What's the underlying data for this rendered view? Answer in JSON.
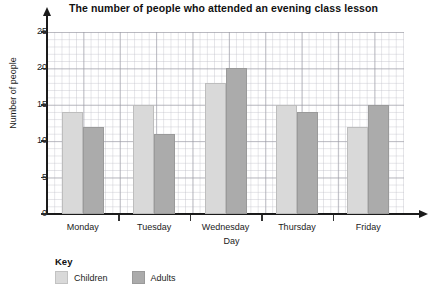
{
  "chart_data": {
    "type": "bar",
    "title": "The number of people who attended an evening class lesson",
    "xlabel": "Day",
    "ylabel": "Number of people",
    "categories": [
      "Monday",
      "Tuesday",
      "Wednesday",
      "Thursday",
      "Friday"
    ],
    "series": [
      {
        "name": "Children",
        "values": [
          14,
          15,
          18,
          15,
          12
        ],
        "color": "#d9d9d9"
      },
      {
        "name": "Adults",
        "values": [
          12,
          11,
          20,
          14,
          15
        ],
        "color": "#ababab"
      }
    ],
    "ylim": [
      0,
      25
    ],
    "yticks": [
      0,
      5,
      10,
      15,
      20,
      25
    ],
    "ytick_labels": [
      "0",
      "5",
      "10",
      "15",
      "20",
      "25"
    ],
    "grid": true,
    "grid_style": "graph-paper",
    "legend_position": "bottom-left",
    "legend_title": "Key"
  },
  "axes": {
    "y_arrow": "arrow-up",
    "x_arrow": "arrow-right"
  }
}
